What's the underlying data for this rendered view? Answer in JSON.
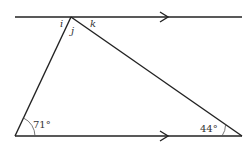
{
  "diagram": {
    "type": "geometry-parallel-lines-triangle",
    "line_color": "#222222",
    "angle_labels": {
      "i": "i",
      "j": "j",
      "k": "k",
      "bottom_left": "71°",
      "bottom_right": "44°"
    },
    "parallel_markers": [
      "top-line-arrow",
      "bottom-line-arrow"
    ]
  }
}
